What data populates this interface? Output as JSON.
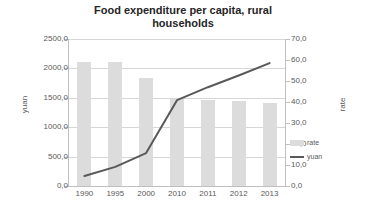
{
  "chart_data": {
    "type": "bar",
    "title": "Food expenditure per capita, rural households",
    "title_line1": "Food expenditure per capita, rural",
    "title_line2": "households",
    "categories": [
      "1990",
      "1995",
      "2000",
      "2010",
      "2011",
      "2012",
      "2013"
    ],
    "xlabel": "",
    "ylabel": "yuan",
    "ylabel_secondary": "rate",
    "ylim": [
      0,
      2500
    ],
    "ylim_secondary": [
      0,
      70
    ],
    "ytick_labels": [
      "0,0",
      "500,0",
      "1000,0",
      "1500,0",
      "2000,0",
      "2500,0"
    ],
    "ytick_values": [
      0,
      500,
      1000,
      1500,
      2000,
      2500
    ],
    "ytick_labels_secondary": [
      "0,0",
      "10,0",
      "20,0",
      "30,0",
      "40,0",
      "50,0",
      "60,0",
      "70,0"
    ],
    "ytick_values_secondary": [
      0,
      10,
      20,
      30,
      40,
      50,
      60,
      70
    ],
    "grid": true,
    "legend_position": "right",
    "series": [
      {
        "name": "rate",
        "type": "bar",
        "axis": "secondary",
        "color": "#dcdcdc",
        "values": [
          59.0,
          59.0,
          51.2,
          41.2,
          41.0,
          40.5,
          39.5
        ]
      },
      {
        "name": "yuan",
        "type": "line",
        "axis": "primary",
        "color": "#595959",
        "values": [
          170,
          325,
          560,
          1460,
          1680,
          1880,
          2090
        ]
      }
    ]
  },
  "legend": {
    "items": [
      {
        "label": "rate",
        "marker": "bar-swatch"
      },
      {
        "label": "yuan",
        "marker": "line-swatch"
      }
    ]
  }
}
